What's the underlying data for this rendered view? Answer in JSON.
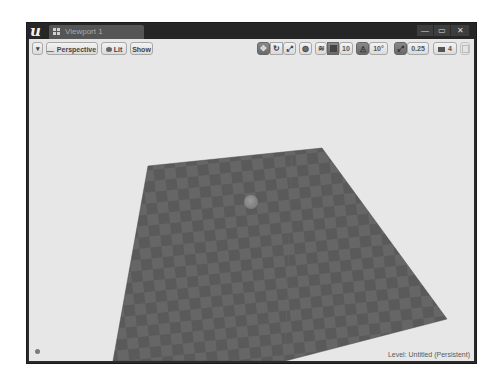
{
  "window": {
    "logo": "u",
    "tab": {
      "label": "Viewport 1",
      "icon": "viewport-grid-icon"
    },
    "controls": {
      "minimize": "—",
      "maximize": "▭",
      "close": "✕"
    }
  },
  "viewport_toolbar": {
    "options_menu": {
      "icon": "chevron-down-icon",
      "glyph": "▾"
    },
    "perspective": {
      "label": "Perspective",
      "icon": "perspective-icon"
    },
    "lit": {
      "label": "Lit",
      "icon": "lit-sphere-icon"
    },
    "show": {
      "label": "Show"
    },
    "transform_tools": [
      {
        "name": "translate",
        "icon": "translate-icon",
        "active": true
      },
      {
        "name": "rotate",
        "icon": "rotate-icon",
        "active": false
      },
      {
        "name": "scale",
        "icon": "scale-icon",
        "active": false
      }
    ],
    "coordinate_system": {
      "icon": "world-globe-icon"
    },
    "surface_snapping": {
      "icon": "surface-snap-icon"
    },
    "grid_snap": {
      "icon": "grid-snap-icon",
      "active": true,
      "value": "10"
    },
    "rotation_snap": {
      "icon": "rotation-snap-icon",
      "active": true,
      "value": "10°"
    },
    "scale_snap": {
      "icon": "scale-snap-icon",
      "active": true,
      "value": "0.25"
    },
    "camera_speed": {
      "icon": "camera-speed-icon",
      "value": "4"
    },
    "maximize_viewport": {
      "icon": "maximize-viewport-icon"
    }
  },
  "scene": {
    "floor_plane": {
      "color_dark": "#555555",
      "color_light": "#626262"
    },
    "sphere": {
      "color": "#888888"
    }
  },
  "status": {
    "level_label": "Level:  Untitled (Persistent)"
  },
  "colors": {
    "window_frame": "#2a2a2a",
    "viewport_bg": "#e7e7e7",
    "toolbar_button": "#e6e6e6",
    "toolbar_active": "#777777"
  }
}
